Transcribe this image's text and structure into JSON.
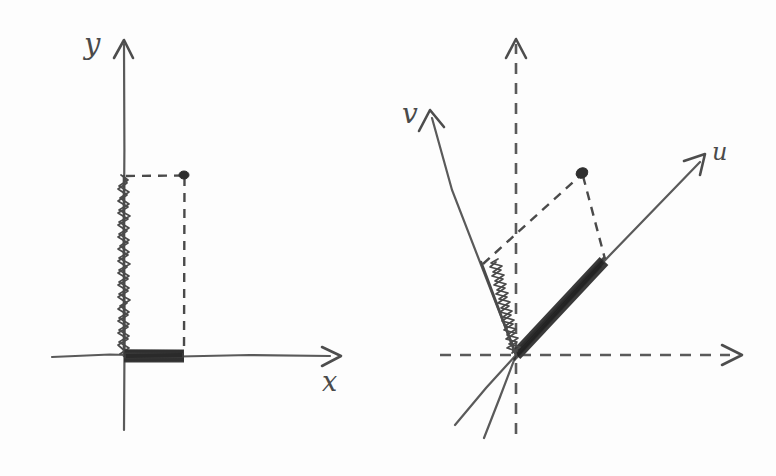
{
  "figure": {
    "background_color": "#fdfdfd",
    "ink_color": "#4a4a4a",
    "style": "hand-drawn pencil sketch"
  },
  "panels": [
    {
      "id": "left-panel",
      "name": "standard-basis-panel",
      "axes": [
        {
          "name": "x-axis",
          "label": "x",
          "style": "solid",
          "direction": "right",
          "arrow": true
        },
        {
          "name": "y-axis",
          "label": "y",
          "style": "solid",
          "direction": "up",
          "arrow": true
        }
      ],
      "origin": {
        "x": 124,
        "y": 356
      },
      "point": {
        "name": "vector-tip",
        "x": 184,
        "y": 176
      },
      "components": [
        {
          "name": "x-component",
          "style": "thick-shaded-bar",
          "from": [
            124,
            356
          ],
          "to": [
            184,
            356
          ]
        },
        {
          "name": "y-component",
          "style": "zigzag-hatched",
          "from": [
            124,
            356
          ],
          "to": [
            124,
            176
          ]
        }
      ],
      "projection_lines": [
        {
          "name": "horizontal-projection-dash",
          "from": [
            124,
            176
          ],
          "to": [
            184,
            176
          ]
        },
        {
          "name": "vertical-projection-dash",
          "from": [
            184,
            176
          ],
          "to": [
            184,
            356
          ]
        }
      ]
    },
    {
      "id": "right-panel",
      "name": "rotated-basis-panel",
      "axes": [
        {
          "name": "u-axis",
          "label": "u",
          "style": "solid",
          "direction": "up-right",
          "arrow": true
        },
        {
          "name": "v-axis",
          "label": "v",
          "style": "solid",
          "direction": "up-left",
          "arrow": true
        },
        {
          "name": "x-axis-reference",
          "label": "",
          "style": "dashed",
          "direction": "right",
          "arrow": true
        },
        {
          "name": "y-axis-reference",
          "label": "",
          "style": "dashed",
          "direction": "up",
          "arrow": true
        }
      ],
      "origin": {
        "x": 516,
        "y": 355
      },
      "point": {
        "name": "vector-tip",
        "x": 582,
        "y": 172
      },
      "components": [
        {
          "name": "u-component",
          "style": "thick-shaded-bar",
          "from": [
            516,
            355
          ],
          "to": [
            604,
            261
          ]
        },
        {
          "name": "v-component",
          "style": "zigzag-hatched",
          "from": [
            516,
            355
          ],
          "to": [
            481,
            262
          ]
        }
      ],
      "projection_lines": [
        {
          "name": "v-parallel-projection-dash",
          "from": [
            481,
            262
          ],
          "to": [
            582,
            172
          ]
        },
        {
          "name": "u-parallel-projection-dash",
          "from": [
            582,
            172
          ],
          "to": [
            604,
            261
          ]
        }
      ]
    }
  ],
  "labels": {
    "left_y": "y",
    "left_x": "x",
    "right_v": "v",
    "right_u": "u"
  }
}
